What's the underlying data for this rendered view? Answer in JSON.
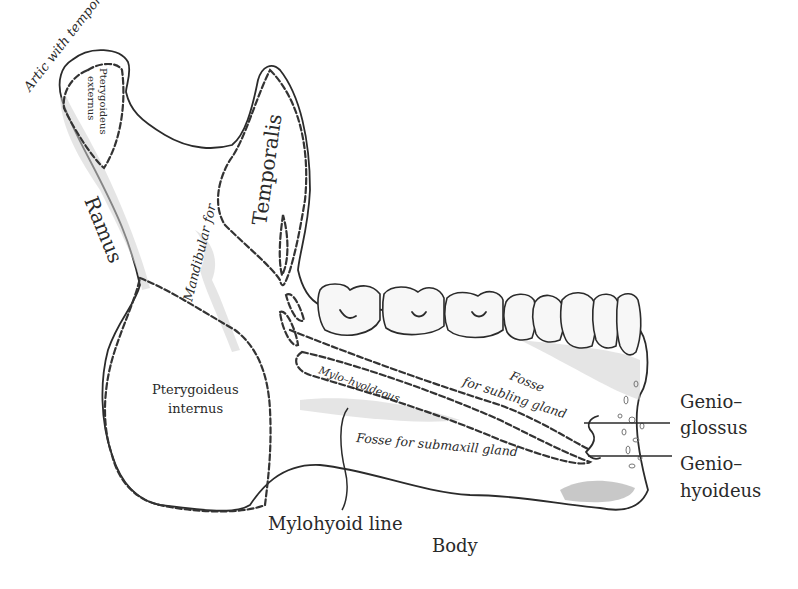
{
  "diagram": {
    "background": "#ffffff",
    "ink_color": "#2b2b2b",
    "labels": {
      "artic": "Artic with temporals",
      "pterygoideus_externus_1": "Pterygoideus",
      "pterygoideus_externus_2": "externus",
      "temporalis": "Temporalis",
      "ramus": "Ramus",
      "mandibular_for": "Mandibular for",
      "pterygoideus_internus_1": "Pterygoideus",
      "pterygoideus_internus_2": "internus",
      "mylo_hyoldeous": "Mylo–hyoldeous",
      "fosse_subling_1": "Fosse",
      "fosse_subling_2": "for subling gland",
      "fosse_submaxill": "Fosse for submaxill gland",
      "genioglossus_1": "Genio–",
      "genioglossus_2": "glossus",
      "geniohyoideus_1": "Genio–",
      "geniohyoideus_2": "hyoideus",
      "mylohyoid_line": "Mylohyoid line",
      "body": "Body"
    },
    "teeth_count": 8
  }
}
